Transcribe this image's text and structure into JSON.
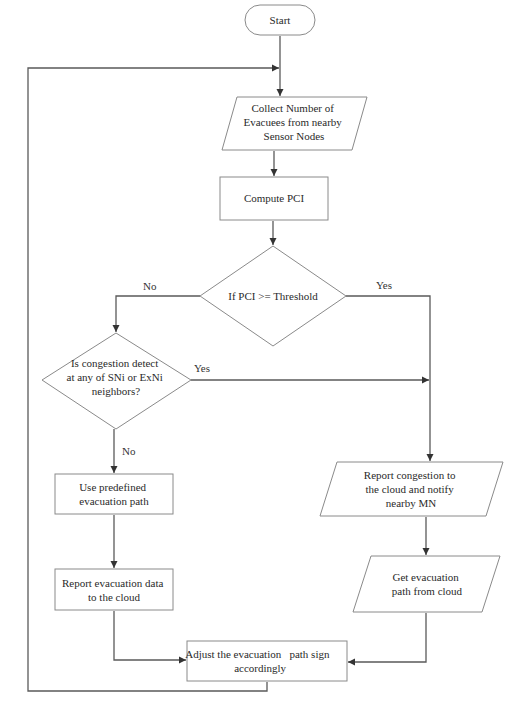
{
  "nodes": {
    "start": {
      "type": "terminal",
      "lines": [
        "Start"
      ]
    },
    "collect": {
      "type": "io",
      "lines": [
        "Collect Number of",
        "Evacuees from nearby",
        "Sensor Nodes"
      ]
    },
    "compute": {
      "type": "process",
      "lines": [
        "Compute PCI"
      ]
    },
    "decision1": {
      "type": "decision",
      "lines": [
        "If PCI >= Threshold"
      ]
    },
    "decision2": {
      "type": "decision",
      "lines": [
        "Is congestion detect",
        "at any of SNi or ExNi",
        "neighbors?"
      ]
    },
    "predefined": {
      "type": "process",
      "lines": [
        "Use predefined",
        "evacuation path"
      ]
    },
    "report_data": {
      "type": "process",
      "lines": [
        "Report evacuation data",
        "to the cloud"
      ]
    },
    "report_congestion": {
      "type": "io",
      "lines": [
        "Report congestion to",
        "the cloud and notify",
        "nearby MN"
      ]
    },
    "get_path": {
      "type": "io",
      "lines": [
        "Get evacuation",
        "path from cloud"
      ]
    },
    "adjust": {
      "type": "process",
      "lines": [
        "Adjust the evacuation   path sign",
        "accordingly"
      ]
    }
  },
  "edges": [
    {
      "from": "start",
      "to": "collect",
      "label": ""
    },
    {
      "from": "collect",
      "to": "compute",
      "label": ""
    },
    {
      "from": "compute",
      "to": "decision1",
      "label": ""
    },
    {
      "from": "decision1",
      "to": "decision2",
      "label": "No"
    },
    {
      "from": "decision1",
      "to": "report_congestion",
      "label": "Yes"
    },
    {
      "from": "decision2",
      "to": "report_congestion",
      "label": "Yes"
    },
    {
      "from": "decision2",
      "to": "predefined",
      "label": "No"
    },
    {
      "from": "predefined",
      "to": "report_data",
      "label": ""
    },
    {
      "from": "report_data",
      "to": "adjust",
      "label": ""
    },
    {
      "from": "report_congestion",
      "to": "get_path",
      "label": ""
    },
    {
      "from": "get_path",
      "to": "adjust",
      "label": ""
    },
    {
      "from": "adjust",
      "to": "collect",
      "label": ""
    }
  ],
  "edge_labels": {
    "d1_no": "No",
    "d1_yes": "Yes",
    "d2_yes": "Yes",
    "d2_no": "No"
  }
}
